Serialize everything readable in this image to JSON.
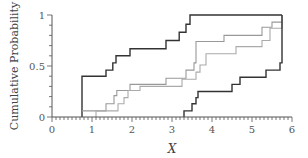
{
  "chart_data": {
    "type": "line",
    "subtype": "step (empirical CDF with confidence bounds)",
    "title": "",
    "xlabel": "X",
    "ylabel": "Cumulative Probability",
    "xlim": [
      0,
      6
    ],
    "ylim": [
      0,
      1
    ],
    "x_ticks": [
      "0",
      "1",
      "2",
      "3",
      "4",
      "5",
      "6"
    ],
    "y_ticks": [
      "0",
      "0.5",
      "1"
    ],
    "x_minor_ticks_per_unit": 10,
    "y_minor_ticks_per_unit": 10,
    "grid": false,
    "legend": null,
    "series": [
      {
        "name": "upper-bound",
        "color": "#333333",
        "points": [
          [
            0.75,
            0
          ],
          [
            0.75,
            0.4
          ],
          [
            1.35,
            0.4
          ],
          [
            1.35,
            0.46
          ],
          [
            1.52,
            0.46
          ],
          [
            1.52,
            0.53
          ],
          [
            1.6,
            0.53
          ],
          [
            1.6,
            0.6
          ],
          [
            1.95,
            0.6
          ],
          [
            1.95,
            0.67
          ],
          [
            2.85,
            0.67
          ],
          [
            2.85,
            0.75
          ],
          [
            3.18,
            0.75
          ],
          [
            3.18,
            0.83
          ],
          [
            3.35,
            0.83
          ],
          [
            3.35,
            0.91
          ],
          [
            3.45,
            0.91
          ],
          [
            3.45,
            1.0
          ],
          [
            5.75,
            1.0
          ]
        ]
      },
      {
        "name": "ecdf-1",
        "color": "#999999",
        "points": [
          [
            0.75,
            0.06
          ],
          [
            1.35,
            0.06
          ],
          [
            1.35,
            0.13
          ],
          [
            1.55,
            0.13
          ],
          [
            1.55,
            0.21
          ],
          [
            1.62,
            0.21
          ],
          [
            1.62,
            0.26
          ],
          [
            1.95,
            0.26
          ],
          [
            1.95,
            0.32
          ],
          [
            2.85,
            0.32
          ],
          [
            2.85,
            0.38
          ],
          [
            3.35,
            0.38
          ],
          [
            3.35,
            0.46
          ],
          [
            3.55,
            0.46
          ],
          [
            3.55,
            0.53
          ],
          [
            3.6,
            0.53
          ],
          [
            3.6,
            0.74
          ],
          [
            4.3,
            0.74
          ],
          [
            4.3,
            0.8
          ],
          [
            5.25,
            0.8
          ],
          [
            5.25,
            0.88
          ],
          [
            5.5,
            0.88
          ],
          [
            5.5,
            0.93
          ],
          [
            5.75,
            0.93
          ],
          [
            5.75,
            1.0
          ]
        ]
      },
      {
        "name": "ecdf-2",
        "color": "#aaaaaa",
        "points": [
          [
            1.1,
            0.0
          ],
          [
            1.1,
            0.06
          ],
          [
            1.65,
            0.06
          ],
          [
            1.65,
            0.13
          ],
          [
            1.8,
            0.13
          ],
          [
            1.8,
            0.19
          ],
          [
            1.9,
            0.19
          ],
          [
            1.9,
            0.26
          ],
          [
            2.2,
            0.26
          ],
          [
            2.2,
            0.3
          ],
          [
            3.25,
            0.3
          ],
          [
            3.25,
            0.37
          ],
          [
            3.6,
            0.37
          ],
          [
            3.6,
            0.44
          ],
          [
            3.7,
            0.44
          ],
          [
            3.7,
            0.51
          ],
          [
            3.85,
            0.51
          ],
          [
            3.85,
            0.62
          ],
          [
            4.6,
            0.62
          ],
          [
            4.6,
            0.69
          ],
          [
            5.25,
            0.69
          ],
          [
            5.25,
            0.75
          ],
          [
            5.45,
            0.75
          ],
          [
            5.45,
            0.87
          ],
          [
            5.75,
            0.87
          ],
          [
            5.75,
            0.93
          ]
        ]
      },
      {
        "name": "lower-bound",
        "color": "#333333",
        "points": [
          [
            3.3,
            0
          ],
          [
            3.3,
            0.06
          ],
          [
            3.5,
            0.06
          ],
          [
            3.5,
            0.13
          ],
          [
            3.6,
            0.13
          ],
          [
            3.6,
            0.19
          ],
          [
            3.65,
            0.19
          ],
          [
            3.65,
            0.25
          ],
          [
            4.5,
            0.25
          ],
          [
            4.5,
            0.32
          ],
          [
            4.7,
            0.32
          ],
          [
            4.7,
            0.39
          ],
          [
            5.35,
            0.39
          ],
          [
            5.35,
            0.46
          ],
          [
            5.7,
            0.46
          ],
          [
            5.7,
            0.53
          ],
          [
            5.75,
            0.53
          ],
          [
            5.75,
            1.0
          ]
        ]
      }
    ]
  },
  "axes": {
    "x_title": "X",
    "y_title": "Cumulative Probability"
  }
}
